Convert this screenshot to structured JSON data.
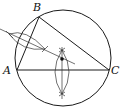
{
  "diagram": {
    "labels": {
      "vertex_a": "A",
      "vertex_b": "B",
      "vertex_c": "C"
    },
    "elements": [
      "circumcircle",
      "triangle ABC",
      "perpendicular bisector of AB",
      "perpendicular bisector of AC",
      "construction arcs",
      "circumcenter point"
    ],
    "colors": {
      "stroke": "#1a1a1a",
      "background": "#ffffff"
    }
  }
}
